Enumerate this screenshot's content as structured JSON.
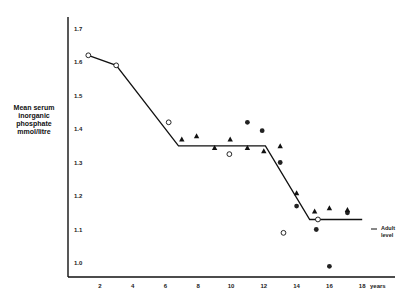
{
  "chart_data": {
    "type": "scatter",
    "title": "",
    "xlabel": "years",
    "ylabel": "Mean serum inorganic phosphate mmol/litre",
    "ylabel_lines": [
      "Mean serum",
      "inorganic",
      "phosphate",
      "mmol/litre"
    ],
    "xlim": [
      0,
      19
    ],
    "ylim": [
      0.97,
      1.72
    ],
    "x_ticks": [
      2,
      4,
      6,
      8,
      10,
      12,
      14,
      16,
      18
    ],
    "y_ticks": [
      1.0,
      1.1,
      1.2,
      1.3,
      1.4,
      1.5,
      1.6,
      1.7
    ],
    "y_tick_labels": [
      "1.0",
      "1.1",
      "1.2",
      "1.3",
      "1.4",
      "1.5",
      "1.6",
      "1.7"
    ],
    "grid": false,
    "legend": null,
    "annotations": [
      {
        "text_lines": [
          "Adult",
          "level"
        ],
        "x": 18.5,
        "y": 1.1,
        "marker": "dash"
      }
    ],
    "trend_line": {
      "name": "fitted trend",
      "x": [
        1.3,
        3.0,
        6.8,
        12.1,
        14.8,
        18.0
      ],
      "y": [
        1.62,
        1.59,
        1.35,
        1.35,
        1.13,
        1.13
      ]
    },
    "series": [
      {
        "name": "open circles",
        "marker": "open-circle",
        "x": [
          1.3,
          3.0,
          6.2,
          9.9,
          13.2,
          15.3
        ],
        "y": [
          1.62,
          1.59,
          1.42,
          1.325,
          1.09,
          1.13
        ]
      },
      {
        "name": "filled circles",
        "marker": "filled-circle",
        "x": [
          11.0,
          11.9,
          13.0,
          14.0,
          15.2,
          16.0,
          17.1
        ],
        "y": [
          1.42,
          1.395,
          1.3,
          1.17,
          1.1,
          0.99,
          1.15
        ]
      },
      {
        "name": "triangles",
        "marker": "filled-triangle",
        "x": [
          7.0,
          7.9,
          9.0,
          9.95,
          11.0,
          12.0,
          13.0,
          14.0,
          15.1,
          16.0,
          17.1
        ],
        "y": [
          1.37,
          1.38,
          1.345,
          1.37,
          1.345,
          1.335,
          1.35,
          1.21,
          1.155,
          1.165,
          1.16
        ]
      }
    ]
  }
}
